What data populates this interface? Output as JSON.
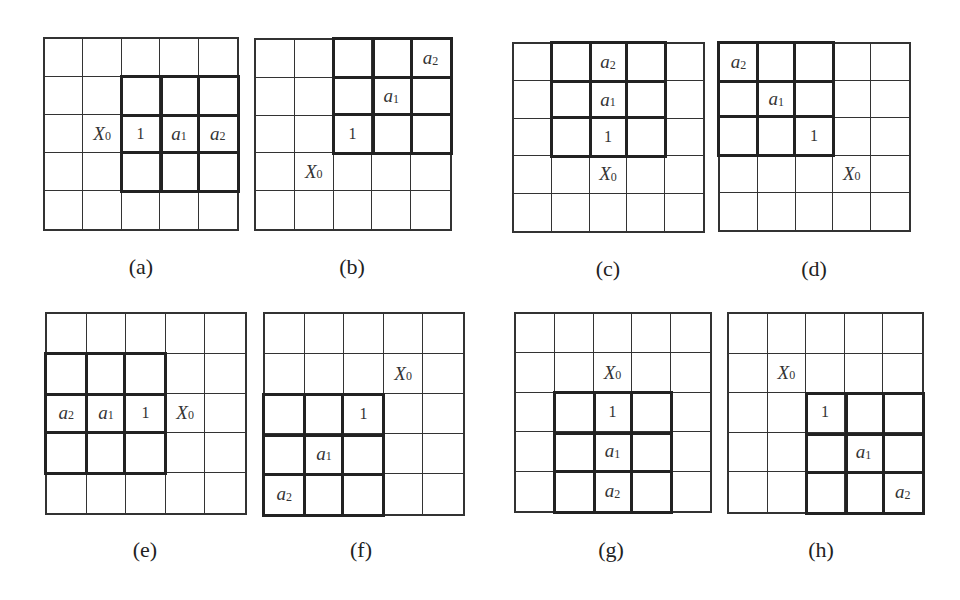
{
  "figure": {
    "panels": [
      {
        "id": "a",
        "caption": "(a)",
        "box": {
          "x": 43,
          "y": 37,
          "w": 196,
          "h": 194
        },
        "caption_pos": {
          "x": 111,
          "y": 254
        },
        "thick_block": {
          "row": 1,
          "col": 2,
          "rows": 3,
          "cols": 3
        },
        "labels": [
          {
            "row": 2,
            "col": 1,
            "base": "X",
            "sub": "0",
            "kind": "var"
          },
          {
            "row": 2,
            "col": 2,
            "base": "1",
            "sub": "",
            "kind": "num"
          },
          {
            "row": 2,
            "col": 3,
            "base": "a",
            "sub": "1",
            "kind": "var"
          },
          {
            "row": 2,
            "col": 4,
            "base": "a",
            "sub": "2",
            "kind": "var"
          }
        ]
      },
      {
        "id": "b",
        "caption": "(b)",
        "box": {
          "x": 254,
          "y": 38,
          "w": 198,
          "h": 193
        },
        "caption_pos": {
          "x": 322,
          "y": 254
        },
        "thick_block": {
          "row": 0,
          "col": 2,
          "rows": 3,
          "cols": 3
        },
        "labels": [
          {
            "row": 0,
            "col": 4,
            "base": "a",
            "sub": "2",
            "kind": "var"
          },
          {
            "row": 1,
            "col": 3,
            "base": "a",
            "sub": "1",
            "kind": "var"
          },
          {
            "row": 2,
            "col": 2,
            "base": "1",
            "sub": "",
            "kind": "num"
          },
          {
            "row": 3,
            "col": 1,
            "base": "X",
            "sub": "0",
            "kind": "var"
          }
        ]
      },
      {
        "id": "c",
        "caption": "(c)",
        "box": {
          "x": 512,
          "y": 42,
          "w": 193,
          "h": 191
        },
        "caption_pos": {
          "x": 578,
          "y": 256
        },
        "thick_block": {
          "row": 0,
          "col": 1,
          "rows": 3,
          "cols": 3
        },
        "labels": [
          {
            "row": 0,
            "col": 2,
            "base": "a",
            "sub": "2",
            "kind": "var"
          },
          {
            "row": 1,
            "col": 2,
            "base": "a",
            "sub": "1",
            "kind": "var"
          },
          {
            "row": 2,
            "col": 2,
            "base": "1",
            "sub": "",
            "kind": "num"
          },
          {
            "row": 3,
            "col": 2,
            "base": "X",
            "sub": "0",
            "kind": "var"
          }
        ]
      },
      {
        "id": "d",
        "caption": "(d)",
        "box": {
          "x": 718,
          "y": 42,
          "w": 193,
          "h": 190
        },
        "caption_pos": {
          "x": 784,
          "y": 256
        },
        "thick_block": {
          "row": 0,
          "col": 0,
          "rows": 3,
          "cols": 3
        },
        "labels": [
          {
            "row": 0,
            "col": 0,
            "base": "a",
            "sub": "2",
            "kind": "var"
          },
          {
            "row": 1,
            "col": 1,
            "base": "a",
            "sub": "1",
            "kind": "var"
          },
          {
            "row": 2,
            "col": 2,
            "base": "1",
            "sub": "",
            "kind": "num"
          },
          {
            "row": 3,
            "col": 3,
            "base": "X",
            "sub": "0",
            "kind": "var"
          }
        ]
      },
      {
        "id": "e",
        "caption": "(e)",
        "box": {
          "x": 45,
          "y": 312,
          "w": 202,
          "h": 203
        },
        "caption_pos": {
          "x": 115,
          "y": 537
        },
        "thick_block": {
          "row": 1,
          "col": 0,
          "rows": 3,
          "cols": 3
        },
        "labels": [
          {
            "row": 2,
            "col": 0,
            "base": "a",
            "sub": "2",
            "kind": "var"
          },
          {
            "row": 2,
            "col": 1,
            "base": "a",
            "sub": "1",
            "kind": "var"
          },
          {
            "row": 2,
            "col": 2,
            "base": "1",
            "sub": "",
            "kind": "num"
          },
          {
            "row": 2,
            "col": 3,
            "base": "X",
            "sub": "0",
            "kind": "var"
          }
        ]
      },
      {
        "id": "f",
        "caption": "(f)",
        "box": {
          "x": 263,
          "y": 312,
          "w": 202,
          "h": 204
        },
        "caption_pos": {
          "x": 331,
          "y": 537
        },
        "thick_block": {
          "row": 2,
          "col": 0,
          "rows": 3,
          "cols": 3
        },
        "labels": [
          {
            "row": 1,
            "col": 3,
            "base": "X",
            "sub": "0",
            "kind": "var"
          },
          {
            "row": 2,
            "col": 2,
            "base": "1",
            "sub": "",
            "kind": "num"
          },
          {
            "row": 3,
            "col": 1,
            "base": "a",
            "sub": "1",
            "kind": "var"
          },
          {
            "row": 4,
            "col": 0,
            "base": "a",
            "sub": "2",
            "kind": "var"
          }
        ]
      },
      {
        "id": "g",
        "caption": "(g)",
        "box": {
          "x": 514,
          "y": 312,
          "w": 198,
          "h": 201
        },
        "caption_pos": {
          "x": 581,
          "y": 537
        },
        "thick_block": {
          "row": 2,
          "col": 1,
          "rows": 3,
          "cols": 3
        },
        "labels": [
          {
            "row": 1,
            "col": 2,
            "base": "X",
            "sub": "0",
            "kind": "var"
          },
          {
            "row": 2,
            "col": 2,
            "base": "1",
            "sub": "",
            "kind": "num"
          },
          {
            "row": 3,
            "col": 2,
            "base": "a",
            "sub": "1",
            "kind": "var"
          },
          {
            "row": 4,
            "col": 2,
            "base": "a",
            "sub": "2",
            "kind": "var"
          }
        ]
      },
      {
        "id": "h",
        "caption": "(h)",
        "box": {
          "x": 727,
          "y": 312,
          "w": 197,
          "h": 202
        },
        "caption_pos": {
          "x": 791,
          "y": 537
        },
        "thick_block": {
          "row": 2,
          "col": 2,
          "rows": 3,
          "cols": 3
        },
        "labels": [
          {
            "row": 1,
            "col": 1,
            "base": "X",
            "sub": "0",
            "kind": "var"
          },
          {
            "row": 2,
            "col": 2,
            "base": "1",
            "sub": "",
            "kind": "num"
          },
          {
            "row": 3,
            "col": 3,
            "base": "a",
            "sub": "1",
            "kind": "var"
          },
          {
            "row": 4,
            "col": 4,
            "base": "a",
            "sub": "2",
            "kind": "var"
          }
        ]
      }
    ],
    "grid_size": 5
  }
}
